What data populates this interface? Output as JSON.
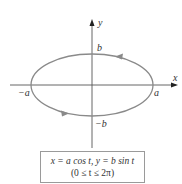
{
  "diagram": {
    "axes": {
      "x_label": "x",
      "y_label": "y"
    },
    "points": {
      "pos_a": "a",
      "neg_a": "−a",
      "pos_b": "b",
      "neg_b": "−b"
    },
    "curve": {
      "type": "ellipse",
      "color": "#8a8a8a",
      "direction": "counterclockwise"
    },
    "equation": {
      "line1": "x = a cos t, y = b sin t",
      "line2": "(0 ≤ t ≤ 2π)"
    }
  }
}
